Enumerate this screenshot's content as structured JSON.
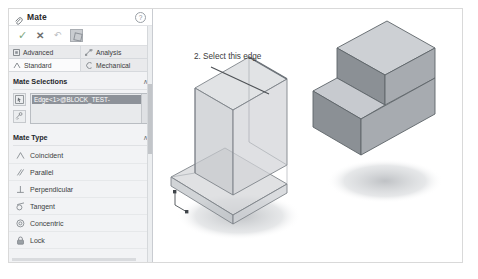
{
  "panel": {
    "title": "Mate",
    "title_icon": "mate-paperclip-icon",
    "help_icon": "help-icon",
    "actions": [
      {
        "name": "ok-button",
        "glyph": "✓",
        "label": "OK"
      },
      {
        "name": "cancel-button",
        "glyph": "✕",
        "label": "Cancel"
      },
      {
        "name": "undo-button",
        "glyph": "↶",
        "label": "Undo"
      },
      {
        "name": "keep-visible-button",
        "glyph": "",
        "label": "Keep Visible"
      }
    ],
    "tabs_row1": [
      {
        "label": "Advanced",
        "icon": "advanced-icon",
        "active": false
      },
      {
        "label": "Analysis",
        "icon": "analysis-icon",
        "active": false
      }
    ],
    "tabs_row2": [
      {
        "label": "Standard",
        "icon": "standard-icon",
        "active": true
      },
      {
        "label": "Mechanical",
        "icon": "mechanical-icon",
        "active": false
      }
    ],
    "mate_selections": {
      "title": "Mate Selections",
      "collapse_glyph": "∧",
      "buttons": [
        {
          "name": "selection-filter-button",
          "icon": "pointer-box-icon"
        },
        {
          "name": "multiple-mate-button",
          "icon": "multi-mate-icon"
        }
      ],
      "items": [
        {
          "text": "Edge<1>@BLOCK_TEST-",
          "selected": true
        }
      ]
    },
    "mate_type": {
      "title": "Mate Type",
      "collapse_glyph": "∧",
      "items": [
        {
          "label": "Coincident",
          "icon": "coincident-icon"
        },
        {
          "label": "Parallel",
          "icon": "parallel-icon"
        },
        {
          "label": "Perpendicular",
          "icon": "perpendicular-icon"
        },
        {
          "label": "Tangent",
          "icon": "tangent-icon"
        },
        {
          "label": "Concentric",
          "icon": "concentric-icon"
        },
        {
          "label": "Lock",
          "icon": "lock-icon"
        }
      ]
    }
  },
  "viewport": {
    "callout": "2. Select this edge",
    "models": [
      {
        "name": "transparent-step-block",
        "style": "transparent"
      },
      {
        "name": "solid-step-block",
        "style": "shaded"
      }
    ]
  },
  "colors": {
    "panel_bg": "#f2f3f5",
    "selection_highlight": "#8d9299",
    "ok_green": "#7ea87e",
    "model_light": "#c8cace",
    "model_dark": "#85898e",
    "shadow": "#c9cbce"
  }
}
